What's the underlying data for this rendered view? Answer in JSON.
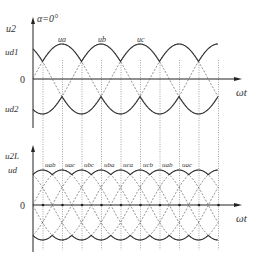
{
  "figure": {
    "top_plot": {
      "y_axis_label": "u2",
      "alpha_label": "α=0°",
      "ud1_label": "ud1",
      "ud2_label": "ud2",
      "zero_label": "0",
      "x_axis_label": "ωt",
      "phase_labels": [
        "ua",
        "ub",
        "uc"
      ]
    },
    "bottom_plot": {
      "y_axis_label": "u2L",
      "ud_label": "ud",
      "zero_label": "0",
      "x_axis_label": "ωt",
      "segment_labels": [
        "uab",
        "uac",
        "ubc",
        "uba",
        "uca",
        "ucb",
        "uab",
        "uac"
      ]
    }
  },
  "chart_data": [
    {
      "type": "line",
      "title": "Three-phase phase voltages, α=0°",
      "xlabel": "ωt",
      "ylabel": "u2",
      "series": [
        {
          "name": "ua",
          "style": "solid-envelope",
          "phase_deg": 0
        },
        {
          "name": "ub",
          "style": "solid-envelope",
          "phase_deg": -120
        },
        {
          "name": "uc",
          "style": "solid-envelope",
          "phase_deg": -240
        }
      ],
      "annotations": [
        "α=0°",
        "ud1",
        "ud2",
        "0"
      ],
      "period_deg": 360,
      "commutation_interval_deg": 60
    },
    {
      "type": "line",
      "title": "Line voltages / rectified output ud",
      "xlabel": "ωt",
      "ylabel": "u2L",
      "series": [
        {
          "name": "uab"
        },
        {
          "name": "uac"
        },
        {
          "name": "ubc"
        },
        {
          "name": "uba"
        },
        {
          "name": "uca"
        },
        {
          "name": "ucb"
        }
      ],
      "segment_sequence": [
        "uab",
        "uac",
        "ubc",
        "uba",
        "uca",
        "ucb",
        "uab",
        "uac"
      ],
      "annotations": [
        "ud",
        "0"
      ],
      "segment_width_deg": 60
    }
  ]
}
